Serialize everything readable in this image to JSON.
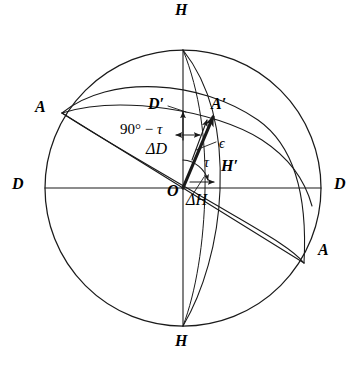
{
  "figure": {
    "kind": "spherical-geometry-diagram",
    "background_color": "#ffffff",
    "stroke_color": "#1a1a1a",
    "geometry": {
      "center": {
        "x": 183,
        "y": 188
      },
      "radius": 138
    },
    "labels": {
      "h_top": "H",
      "h_bottom": "H",
      "d_left": "D",
      "d_right": "D",
      "a_left": "A",
      "a_right": "A",
      "d_prime": "D′",
      "a_prime": "A′",
      "h_prime": "H′",
      "origin": "O",
      "epsilon": "ϵ",
      "tau": "τ",
      "delta_d": "ΔD",
      "delta_h": "ΔH",
      "complement_tau_prefix": "90° − ",
      "complement_tau_symbol": "τ"
    },
    "label_positions": {
      "h_top": {
        "x": 175,
        "y": 2
      },
      "h_bottom": {
        "x": 175,
        "y": 333
      },
      "d_left": {
        "x": 12,
        "y": 176
      },
      "d_right": {
        "x": 334,
        "y": 176
      },
      "a_left": {
        "x": 35,
        "y": 99
      },
      "a_right": {
        "x": 318,
        "y": 242
      },
      "d_prime": {
        "x": 148,
        "y": 96
      },
      "a_prime": {
        "x": 211,
        "y": 96
      },
      "h_prime": {
        "x": 221,
        "y": 158
      },
      "origin": {
        "x": 167,
        "y": 183
      },
      "epsilon": {
        "x": 219,
        "y": 137
      },
      "tau": {
        "x": 204,
        "y": 156
      },
      "delta_d": {
        "x": 146,
        "y": 141
      },
      "delta_h": {
        "x": 186,
        "y": 192
      },
      "complement_tau": {
        "x": 120,
        "y": 122
      }
    }
  }
}
